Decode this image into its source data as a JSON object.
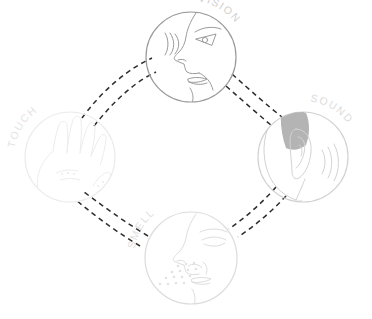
{
  "diagram": {
    "type": "cycle-diagram",
    "width": 372,
    "height": 319,
    "background": "#ffffff",
    "layout": "diamond",
    "nodes": [
      {
        "id": "vision",
        "label": "VISION",
        "icon": "eye-face-profile-icon",
        "description": "Side profile of a human face looking right with visible eye",
        "cx": 191,
        "cy": 57,
        "r": 45,
        "stroke": "#9a9a9a",
        "label_color": "#cfcfcf",
        "label_angle": 46,
        "label_radius": 56,
        "position": "top"
      },
      {
        "id": "sound",
        "label": "SOUND",
        "icon": "ear-head-icon",
        "description": "Head seen from behind with ear and sound waves",
        "cx": 303,
        "cy": 157,
        "r": 45,
        "stroke": "#d2d2d2",
        "label_color": "#dcdcdc",
        "label_angle": 46,
        "label_radius": 56,
        "position": "right",
        "hair_fill": "#b4b4b4"
      },
      {
        "id": "smell",
        "label": "SMELL",
        "icon": "nose-face-profile-icon",
        "description": "Side profile of a face with nose and scent particles",
        "cx": 191,
        "cy": 258,
        "r": 46,
        "stroke": "#dcdcdc",
        "label_color": "#e0e0e0",
        "label_angle": -46,
        "label_radius": 57,
        "position": "bottom"
      },
      {
        "id": "touch",
        "label": "TOUCH",
        "icon": "hand-palm-icon",
        "description": "Open hand with five fingers",
        "cx": 70,
        "cy": 157,
        "r": 45,
        "stroke": "#ececec",
        "label_color": "#e4e4e4",
        "label_angle": -46,
        "label_radius": 56,
        "position": "left"
      }
    ],
    "connectors": [
      {
        "id": "touch-vision",
        "from": "touch",
        "to": "vision",
        "style": "double-dashed-arc",
        "color": "#2d2d2d"
      },
      {
        "id": "vision-sound",
        "from": "vision",
        "to": "sound",
        "style": "double-dashed-arc",
        "color": "#2d2d2d"
      },
      {
        "id": "sound-smell",
        "from": "sound",
        "to": "smell",
        "style": "double-dashed-arc",
        "color": "#2d2d2d"
      },
      {
        "id": "smell-touch",
        "from": "smell",
        "to": "touch",
        "style": "double-dashed-arc",
        "color": "#2d2d2d"
      }
    ],
    "colors": {
      "connector": "#2d2d2d",
      "vision_stroke": "#9a9a9a",
      "sound_stroke": "#d2d2d2",
      "smell_stroke": "#dcdcdc",
      "touch_stroke": "#ececec",
      "hair_fill": "#b4b4b4",
      "background": "#ffffff"
    }
  }
}
